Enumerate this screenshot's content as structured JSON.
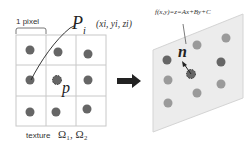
{
  "left_panel": {
    "pixel_label": "1 pixel",
    "point_label_main": "P",
    "point_label_sub": "i",
    "point_coords": "(xi, yi, zi)",
    "center_label": "p",
    "texture_label": "texture",
    "omega_label": "Ω₁, Ω₂",
    "grid": {
      "rows": 3,
      "cols": 3
    }
  },
  "arrow": {
    "direction": "right"
  },
  "right_panel": {
    "equation": "f(x,y)=z=Ax+By+C",
    "normal_label": "n"
  },
  "colors": {
    "grid_line": "#c8c8c8",
    "dot_dark": "#666666",
    "dot_light": "#9a9a9a",
    "plane_fill": "#ececec",
    "plane_stroke": "#d4d4d4",
    "arrow": "#222222",
    "text": "#333333"
  }
}
